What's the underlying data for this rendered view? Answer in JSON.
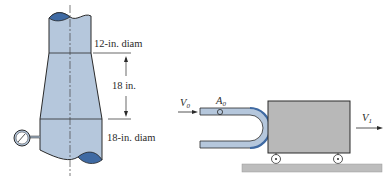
{
  "figure": {
    "left": {
      "top_diameter_label": "12-in. diam",
      "height_label": "18 in.",
      "bottom_diameter_label": "18-in. diam"
    },
    "right": {
      "inlet_velocity_label": "V",
      "inlet_velocity_sub": "0",
      "area_label": "A",
      "area_sub": "0",
      "outlet_velocity_label": "V",
      "outlet_velocity_sub": "1"
    }
  },
  "colors": {
    "pipe_fill": "#b5c7dc",
    "pipe_dark": "#3f6aa3",
    "outline": "#2a2a2a",
    "cart_fill": "#b8b8b8",
    "ground_fill": "#bdbdbd"
  }
}
